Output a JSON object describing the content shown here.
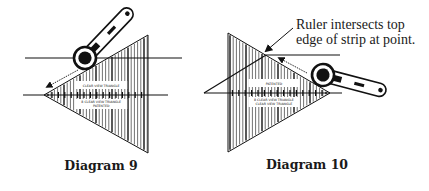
{
  "colors": {
    "ink": "#111111",
    "paper": "#ffffff"
  },
  "diagrams": [
    {
      "id": "diagram-9",
      "caption": "Diagram 9",
      "caption_pos": [
        101,
        158
      ],
      "ruler_triangle": {
        "apex": [
          44,
          95
        ],
        "base_x": 148,
        "base_top": 35,
        "base_bottom": 153,
        "direction": "apex-left"
      },
      "ruler_text": [
        "CLEAR VIEW TRIANGLE",
        "8 CLEAR VIEW TRIANGLE",
        "PATENTED"
      ],
      "strip_lines": [
        {
          "x1": 25,
          "y1": 58,
          "x2": 182,
          "y2": 58
        },
        {
          "x1": 23,
          "y1": 95,
          "x2": 168,
          "y2": 95
        }
      ],
      "cutter": {
        "blade": [
          85,
          58
        ],
        "handle_end": [
          127,
          14
        ],
        "blade_r": 11
      },
      "cut_arrow": {
        "from": [
          78,
          70
        ],
        "to": [
          47,
          87
        ],
        "dashed": true
      }
    },
    {
      "id": "diagram-10",
      "caption": "Diagram 10",
      "caption_pos": [
        307,
        157
      ],
      "ruler_triangle": {
        "apex": [
          330,
          93
        ],
        "base_x": 228,
        "base_top": 33,
        "base_bottom": 152,
        "direction": "apex-right"
      },
      "ruler_text": [
        "PATENTED",
        "8 CLEAR VIEW TRIANGLE",
        "CLEAR VIEW TRIANGLE"
      ],
      "strip_lines": [
        {
          "x1": 266,
          "y1": 55,
          "x2": 340,
          "y2": 55
        },
        {
          "x1": 204,
          "y1": 93,
          "x2": 266,
          "y2": 55
        },
        {
          "x1": 204,
          "y1": 93,
          "x2": 342,
          "y2": 93
        }
      ],
      "cutter": {
        "blade": [
          323,
          75
        ],
        "handle_end": [
          380,
          90
        ],
        "blade_r": 11
      },
      "cut_arrow": {
        "from": [
          307,
          73
        ],
        "to": [
          279,
          58
        ],
        "dashed": true
      }
    }
  ],
  "annotation": {
    "line1": "Ruler intersects top",
    "line2": "edge of strip at point.",
    "pos": [
      296,
      17
    ],
    "pointer": {
      "from": [
        293,
        28
      ],
      "to": [
        266,
        51
      ]
    }
  }
}
